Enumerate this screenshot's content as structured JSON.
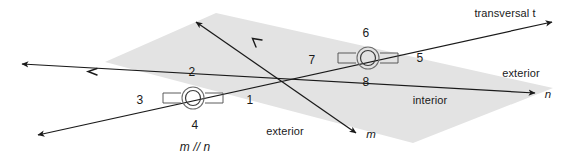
{
  "figure": {
    "colors": {
      "line": "#1a1a1a",
      "shade": "#e2e2e2",
      "text": "#1a1a1a",
      "background": "#ffffff"
    },
    "lines": [
      {
        "name": "line-n",
        "label": "n",
        "label_x": 548,
        "label_y": 95,
        "x1": 22,
        "y1": 64,
        "x2": 535,
        "y2": 93
      },
      {
        "name": "line-m",
        "label": "m",
        "label_x": 371,
        "label_y": 135,
        "x1": 196,
        "y1": 22,
        "x2": 356,
        "y2": 133
      },
      {
        "name": "transversal-t",
        "label": "transversal t",
        "label_x": 505,
        "label_y": 13,
        "x1": 38,
        "y1": 135,
        "x2": 552,
        "y2": 22
      }
    ],
    "intersections": [
      {
        "name": "intersection-m-n-lower",
        "cx": 193,
        "cy": 98
      },
      {
        "name": "intersection-m-n-upper",
        "cx": 368,
        "cy": 58
      }
    ],
    "angle_labels": [
      {
        "text": "1",
        "x": 250,
        "y": 100
      },
      {
        "text": "2",
        "x": 192,
        "y": 72
      },
      {
        "text": "3",
        "x": 140,
        "y": 100
      },
      {
        "text": "4",
        "x": 195,
        "y": 125
      },
      {
        "text": "5",
        "x": 420,
        "y": 58
      },
      {
        "text": "6",
        "x": 366,
        "y": 33
      },
      {
        "text": "7",
        "x": 312,
        "y": 60
      },
      {
        "text": "8",
        "x": 366,
        "y": 82
      }
    ],
    "region_labels": [
      {
        "name": "interior-label",
        "text": "interior",
        "x": 430,
        "y": 100,
        "italic": false
      },
      {
        "name": "exterior-label-right",
        "text": "exterior",
        "x": 521,
        "y": 73,
        "italic": false
      },
      {
        "name": "exterior-label-bottom",
        "text": "exterior",
        "x": 285,
        "y": 131,
        "italic": false
      }
    ],
    "caption": {
      "name": "parallel-notation",
      "text": "m // n",
      "x": 195,
      "y": 147
    },
    "transversal_label": {
      "name": "transversal-label",
      "prefix": "transversal ",
      "symbol": "t"
    }
  }
}
